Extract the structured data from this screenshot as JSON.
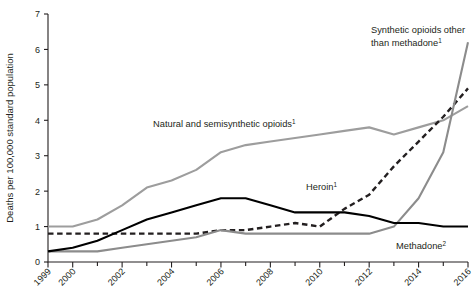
{
  "chart_data": {
    "type": "line",
    "title": "",
    "xlabel": "",
    "ylabel": "Deaths per 100,000 standard population",
    "x": [
      1999,
      2000,
      2001,
      2002,
      2003,
      2004,
      2005,
      2006,
      2007,
      2008,
      2009,
      2010,
      2011,
      2012,
      2013,
      2014,
      2015,
      2016
    ],
    "xlim": [
      1999,
      2016
    ],
    "ylim": [
      0,
      7
    ],
    "yticks": [
      "0",
      "1",
      "2",
      "3",
      "4",
      "5",
      "6",
      "7"
    ],
    "xticks_labeled": [
      "1999",
      "2000",
      "2002",
      "2004",
      "2006",
      "2008",
      "2010",
      "2012",
      "2014",
      "2016"
    ],
    "grid": false,
    "legend_position": "inline-annotations",
    "series": [
      {
        "name": "Natural and semisynthetic opioids",
        "footnote": "1",
        "color": "#9d9d9d",
        "style": "solid",
        "label_text": "Natural and semisynthetic opioids",
        "values": [
          1.0,
          1.0,
          1.2,
          1.6,
          2.1,
          2.3,
          2.6,
          3.1,
          3.3,
          3.4,
          3.5,
          3.6,
          3.7,
          3.8,
          3.6,
          3.8,
          4.0,
          4.4
        ]
      },
      {
        "name": "Heroin",
        "footnote": "1",
        "color": "#231f20",
        "style": "dashed",
        "label_text": "Heroin",
        "values": [
          0.8,
          0.8,
          0.8,
          0.8,
          0.8,
          0.8,
          0.8,
          0.9,
          0.9,
          1.0,
          1.1,
          1.0,
          1.5,
          1.9,
          2.7,
          3.4,
          4.1,
          4.9
        ]
      },
      {
        "name": "Synthetic opioids other than methadone",
        "footnote": "1",
        "color": "#8c8c8c",
        "style": "solid",
        "label_text": "Synthetic opioids other than methadone",
        "values": [
          0.3,
          0.3,
          0.3,
          0.4,
          0.5,
          0.6,
          0.7,
          0.9,
          0.8,
          0.8,
          0.8,
          0.8,
          0.8,
          0.8,
          1.0,
          1.8,
          3.1,
          6.2
        ]
      },
      {
        "name": "Methadone",
        "footnote": "2",
        "color": "#000000",
        "style": "solid",
        "label_text": "Methadone",
        "values": [
          0.3,
          0.4,
          0.6,
          0.9,
          1.2,
          1.4,
          1.6,
          1.8,
          1.8,
          1.6,
          1.4,
          1.4,
          1.4,
          1.3,
          1.1,
          1.1,
          1.0,
          1.0
        ]
      }
    ],
    "annotations": [
      {
        "name": "natural-label",
        "text": "Natural and semisynthetic opioids",
        "sup": "1",
        "x": 153,
        "y": 127
      },
      {
        "name": "synthetic-label-line1",
        "text": "Synthetic opioids other",
        "sup": "",
        "x": 371,
        "y": 33
      },
      {
        "name": "synthetic-label-line2",
        "text": "than methadone",
        "sup": "1",
        "x": 371,
        "y": 46
      },
      {
        "name": "heroin-label",
        "text": "Heroin",
        "sup": "1",
        "x": 306,
        "y": 190
      },
      {
        "name": "methadone-label",
        "text": "Methadone",
        "sup": "2",
        "x": 396,
        "y": 249
      }
    ]
  }
}
